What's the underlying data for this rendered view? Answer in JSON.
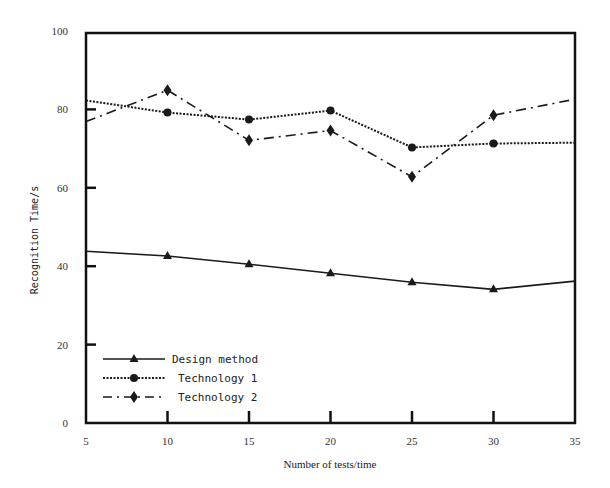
{
  "chart_data": {
    "type": "line",
    "title": "",
    "xlabel": "Number of tests/time",
    "ylabel": "Recognition Time/s",
    "x": [
      5,
      10,
      15,
      20,
      25,
      30,
      35
    ],
    "xticks": [
      "5",
      "10",
      "15",
      "20",
      "25",
      "30",
      "35"
    ],
    "yticks": [
      "0",
      "20",
      "40",
      "60",
      "80",
      "100"
    ],
    "xlim": [
      5,
      35
    ],
    "ylim": [
      0,
      100
    ],
    "grid": false,
    "legend_position": "lower left",
    "series": [
      {
        "name": "Design method",
        "marker": "triangle",
        "linestyle": "solid",
        "values": [
          43.8,
          42.6,
          40.5,
          38.2,
          35.9,
          34.1,
          36.2
        ]
      },
      {
        "name": "Technology 1",
        "marker": "circle",
        "linestyle": "dotted",
        "values": [
          82.3,
          79.2,
          77.4,
          79.7,
          70.3,
          71.3,
          71.5
        ]
      },
      {
        "name": "Technology 2",
        "marker": "diamond",
        "linestyle": "dashdot",
        "values": [
          76.9,
          84.9,
          72.1,
          74.6,
          62.8,
          78.5,
          82.6
        ]
      }
    ]
  },
  "legend": {
    "items": [
      "Design method",
      "Technology 1",
      "Technology 2"
    ]
  },
  "colors": {
    "line": "#1a1a1a",
    "axis": "#111111"
  }
}
